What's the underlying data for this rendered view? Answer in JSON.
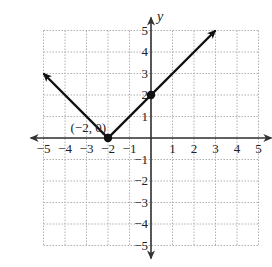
{
  "chart_data": {
    "type": "line",
    "title": "",
    "xlabel": "x",
    "ylabel": "y",
    "xlim": [
      -5,
      5
    ],
    "ylim": [
      -5,
      5
    ],
    "grid": true,
    "xticks": [
      -5,
      -4,
      -3,
      -2,
      -1,
      1,
      2,
      3,
      4,
      5
    ],
    "yticks": [
      -5,
      -4,
      -3,
      -2,
      -1,
      1,
      2,
      3,
      4,
      5
    ],
    "xtick_labels": [
      "−5",
      "−4",
      "−3",
      "−2",
      "−1",
      "1",
      "2",
      "3",
      "4",
      "5"
    ],
    "ytick_labels": [
      "−5",
      "−4",
      "−3",
      "−2",
      "−1",
      "1",
      "2",
      "3",
      "4",
      "5"
    ],
    "series": [
      {
        "name": "y = |x + 2|",
        "x": [
          -5,
          -2,
          3
        ],
        "y": [
          3,
          0,
          5
        ],
        "arrows": "both-ends"
      }
    ],
    "points": [
      {
        "x": -2,
        "y": 0,
        "label": "(−2, 0)"
      },
      {
        "x": 0,
        "y": 2,
        "label": ""
      }
    ],
    "annotations": [
      {
        "text": "(−2, 0)",
        "x": -2,
        "y": 0
      }
    ]
  },
  "layout": {
    "origin_px": [
      151,
      138
    ],
    "unit_px": 21.5,
    "line_color": "#111111",
    "axis_color": "#333333",
    "grid_color": "#b0b0b0"
  }
}
